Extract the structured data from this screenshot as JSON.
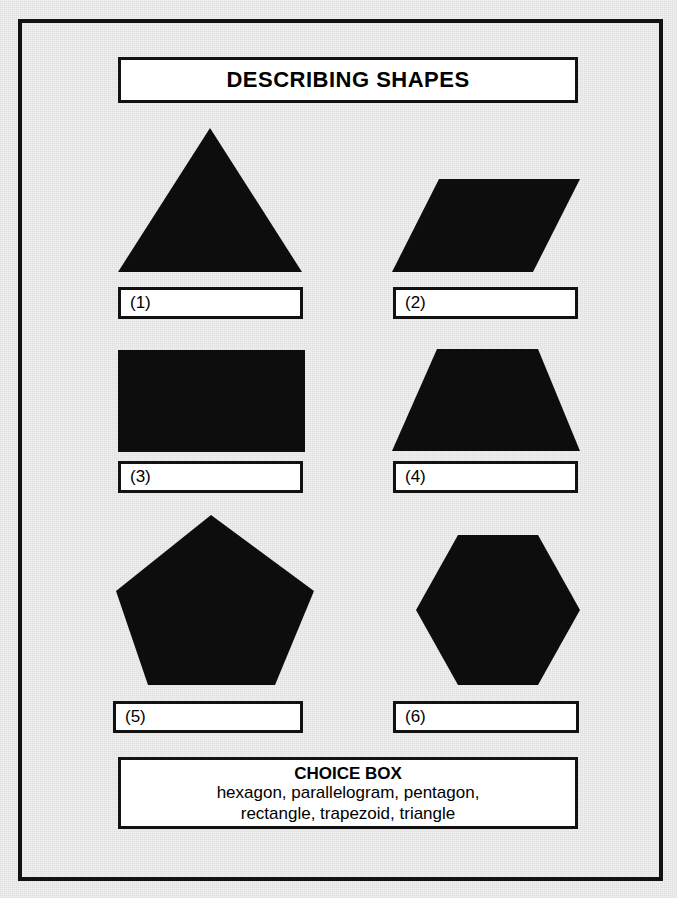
{
  "worksheet": {
    "title": "DESCRIBING SHAPES",
    "ink_color": "#0d0d0d",
    "paper_color": "#f1f1f0"
  },
  "shapes": [
    {
      "number": "1",
      "name": "triangle-shape",
      "answer_label": "(1)"
    },
    {
      "number": "2",
      "name": "parallelogram-shape",
      "answer_label": "(2)"
    },
    {
      "number": "3",
      "name": "rectangle-shape",
      "answer_label": "(3)"
    },
    {
      "number": "4",
      "name": "trapezoid-shape",
      "answer_label": "(4)"
    },
    {
      "number": "5",
      "name": "pentagon-shape",
      "answer_label": "(5)"
    },
    {
      "number": "6",
      "name": "hexagon-shape",
      "answer_label": "(6)"
    }
  ],
  "choice_box": {
    "title": "CHOICE BOX",
    "line1": "hexagon, parallelogram, pentagon,",
    "line2": "rectangle, trapezoid, triangle",
    "options": [
      "hexagon",
      "parallelogram",
      "pentagon",
      "rectangle",
      "trapezoid",
      "triangle"
    ]
  }
}
